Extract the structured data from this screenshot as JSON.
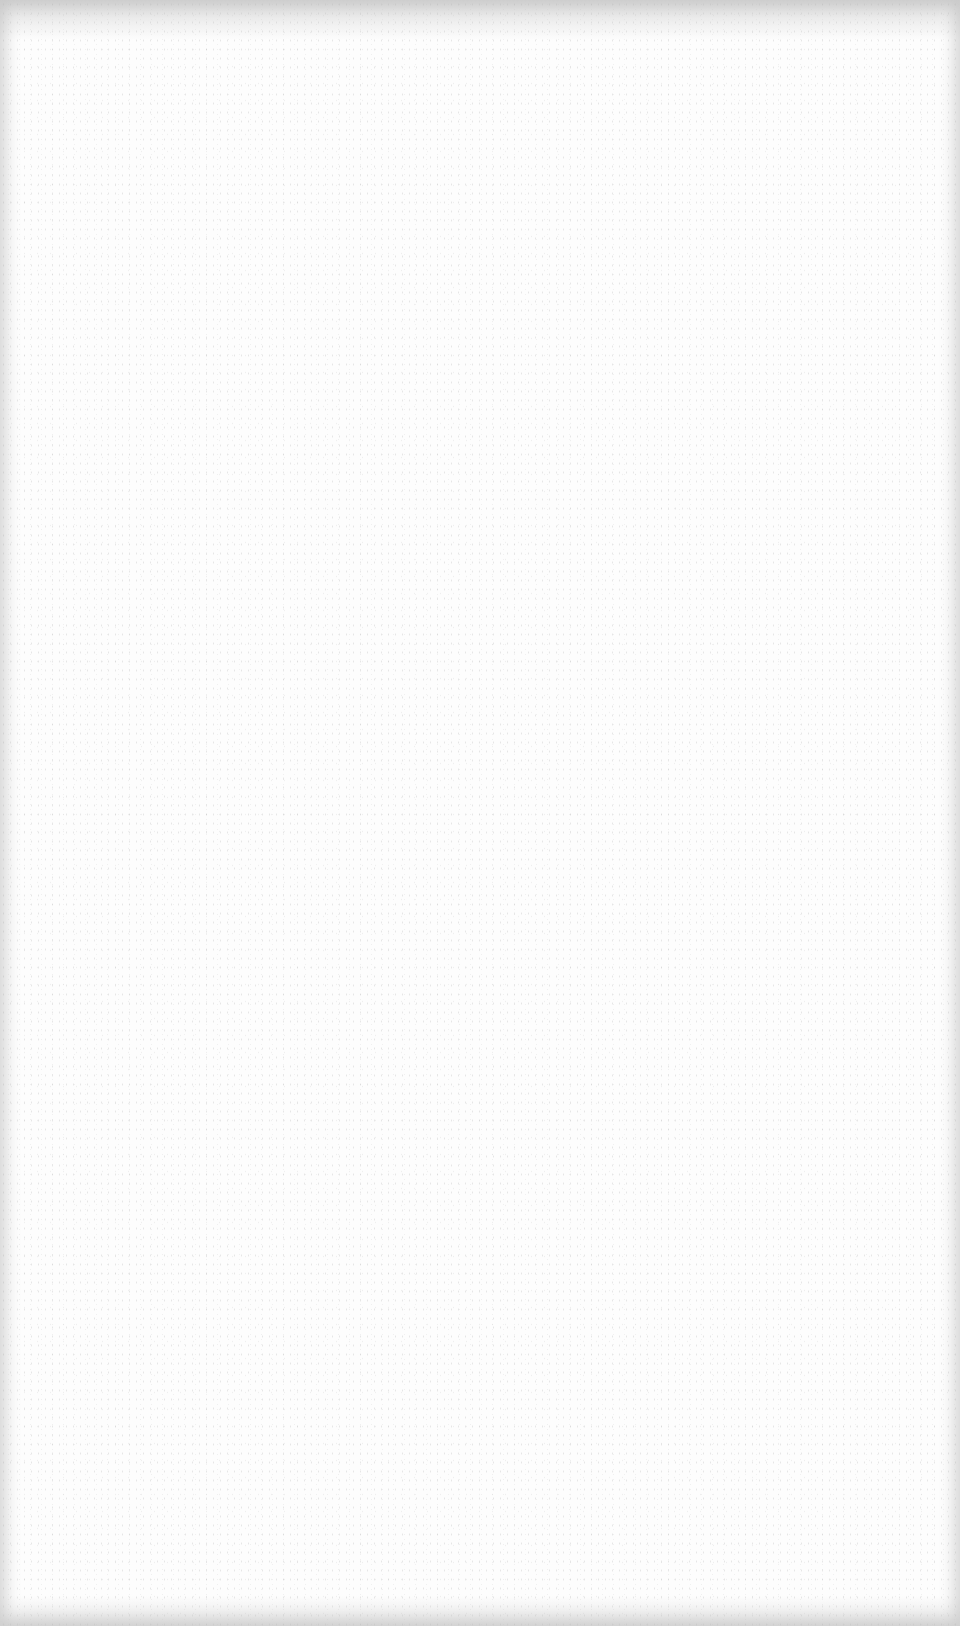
{
  "page": {
    "type": "blank scanned page",
    "background_color": "#fdfdfd",
    "edge_shadow_color": "#c8c8c8",
    "faint_mark": ""
  }
}
